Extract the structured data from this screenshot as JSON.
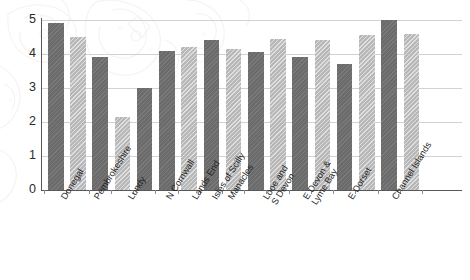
{
  "chart_data": {
    "type": "bar",
    "title": "",
    "subtitle": "",
    "xlabel": "",
    "ylabel": "",
    "ylim": [
      0,
      5
    ],
    "yticks": [
      0,
      1,
      2,
      3,
      4,
      5
    ],
    "ytick_labels": [
      "0",
      "1",
      "2",
      "3",
      "4",
      "5"
    ],
    "grid": true,
    "legend": "none",
    "categories": [
      "Donegal",
      "Pembrokeshire",
      "Lundy",
      "N Cornwall",
      "Lands End",
      "Isles of Scilly",
      "Manacles",
      "Looe and\nS Devon",
      "E Devon &\nLyme Bay",
      "E Dorset",
      "Channel Islands"
    ],
    "series": [
      {
        "name": "dark",
        "color": "#6b6b6b",
        "values": [
          4.9,
          3.9,
          2.15,
          4.1,
          null,
          null,
          4.15,
          3.9,
          3.7,
          5.0,
          null
        ]
      },
      {
        "name": "light",
        "color": "#b8b8b8",
        "values": [
          4.5,
          null,
          3.0,
          4.2,
          null,
          4.4,
          4.05,
          4.45,
          4.4,
          4.55,
          4.6
        ]
      }
    ],
    "bars": [
      {
        "category": "Donegal",
        "style": "dark",
        "value": 4.9
      },
      {
        "category": "Donegal",
        "style": "light",
        "value": 4.5
      },
      {
        "category": "Pembrokeshire",
        "style": "dark",
        "value": 3.9
      },
      {
        "category": "Lundy",
        "style": "light",
        "value": 2.15
      },
      {
        "category": "Lundy",
        "style": "dark",
        "value": 3.0
      },
      {
        "category": "N Cornwall",
        "style": "dark",
        "value": 4.1
      },
      {
        "category": "Lands End",
        "style": "light",
        "value": 4.2
      },
      {
        "category": "Manacles",
        "style": "dark",
        "value": 4.4
      },
      {
        "category": "Manacles",
        "style": "light",
        "value": 4.15
      },
      {
        "category": "Looe and S Devon",
        "style": "dark",
        "value": 4.05
      },
      {
        "category": "Looe and S Devon",
        "style": "light",
        "value": 4.45
      },
      {
        "category": "E Devon & Lyme Bay",
        "style": "dark",
        "value": 3.9
      },
      {
        "category": "E Devon & Lyme Bay",
        "style": "light",
        "value": 4.4
      },
      {
        "category": "E Dorset",
        "style": "dark",
        "value": 3.7
      },
      {
        "category": "E Dorset",
        "style": "light",
        "value": 4.55
      },
      {
        "category": "Channel Islands",
        "style": "dark",
        "value": 5.0
      },
      {
        "category": "Channel Islands",
        "style": "light",
        "value": 4.6
      }
    ]
  },
  "colors": {
    "dark_bar": "#6b6b6b",
    "light_bar": "#b8b8b8",
    "gridline": "#d2d2d2",
    "axis": "#58585a",
    "text": "#1f1f1f",
    "background": "#ffffff"
  }
}
